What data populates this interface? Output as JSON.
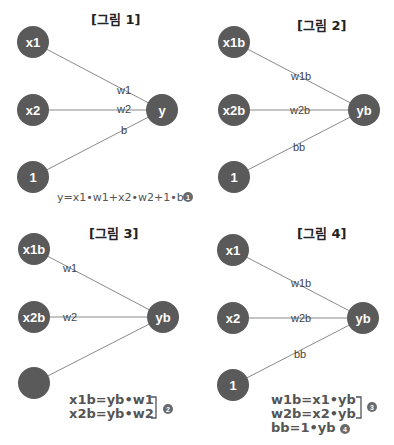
{
  "figures": [
    {
      "title": "[그림 1]",
      "nodes": [
        "x1",
        "x2",
        "1",
        "y"
      ],
      "edges": [
        "w1",
        "w2",
        "b"
      ],
      "formula": "y=x1•w1+x2•w2+1•b",
      "badge": "1"
    },
    {
      "title": "[그림 2]",
      "nodes": [
        "x1b",
        "x2b",
        "1",
        "yb"
      ],
      "edges": [
        "w1b",
        "w2b",
        "bb"
      ]
    },
    {
      "title": "[그림 3]",
      "nodes": [
        "x1b",
        "x2b",
        "",
        "yb"
      ],
      "edges": [
        "w1",
        "w2"
      ],
      "formulas": [
        "x1b=yb•w1",
        "x2b=yb•w2"
      ],
      "badge": "2"
    },
    {
      "title": "[그림 4]",
      "nodes": [
        "x1",
        "x2",
        "1",
        "yb"
      ],
      "edges": [
        "w1b",
        "w2b",
        "bb"
      ],
      "formulas": [
        "w1b=x1•yb",
        "w2b=x2•yb",
        "bb=1•yb"
      ],
      "badges": [
        "3",
        "4"
      ]
    }
  ],
  "colors": {
    "node": "#5a5a5a",
    "edge": "#8a8a8a",
    "text": "#222222"
  }
}
